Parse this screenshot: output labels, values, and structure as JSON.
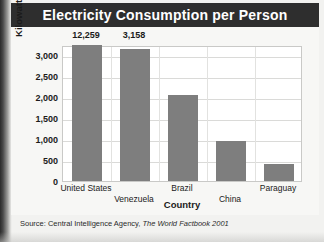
{
  "figure": {
    "title": "Electricity Consumption per Person",
    "source_prefix": "Source: Central Intelligence Agency,",
    "source_italic": "The World Factbook 2001"
  },
  "colors": {
    "title_banner": "#2e2e2e",
    "title_text": "#ffffff",
    "bar_fill": "#7e7e7e",
    "plot_background": "#ffffff",
    "figure_background": "#f2f2f0",
    "gridline": "#dadad8"
  },
  "chart_data": {
    "type": "bar",
    "title": "Electricity Consumption per Person",
    "xlabel": "Country",
    "ylabel": "Kilowatts (per hour)",
    "categories": [
      "United States",
      "Venezuela",
      "Brazil",
      "China",
      "Paraguay"
    ],
    "values": [
      12259,
      3158,
      2050,
      950,
      400
    ],
    "value_labels": [
      "12,259",
      "3,158",
      "",
      "",
      ""
    ],
    "ylim": [
      0,
      3250
    ],
    "yticks": [
      0,
      500,
      1000,
      1500,
      2000,
      2500,
      3000
    ],
    "ytick_labels": [
      "0",
      "500",
      "1,000",
      "1,500",
      "2,000",
      "2,500",
      "3,000"
    ],
    "grid": true,
    "legend": "none",
    "axis_break": {
      "series_index": 0,
      "note": "bar truncated; actual value 12,259 exceeds axis maximum"
    }
  }
}
